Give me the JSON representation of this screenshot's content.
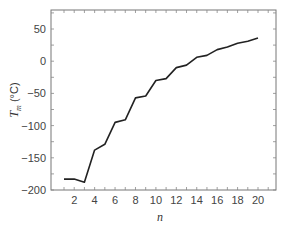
{
  "chart_data": {
    "type": "line",
    "title": "",
    "xlabel": "n",
    "ylabel": "T_m (°C)",
    "ylabel_main": "T",
    "ylabel_sub": "m",
    "ylabel_unit": "(°C)",
    "xlim": [
      0,
      22
    ],
    "ylim": [
      -200,
      80
    ],
    "grid": false,
    "legend": null,
    "x_ticks": [
      2,
      4,
      6,
      8,
      10,
      12,
      14,
      16,
      18,
      20
    ],
    "y_ticks": [
      -200,
      -150,
      -100,
      -50,
      0,
      50
    ],
    "x": [
      1,
      2,
      3,
      4,
      5,
      6,
      7,
      8,
      9,
      10,
      11,
      12,
      13,
      14,
      15,
      16,
      17,
      18,
      19,
      20
    ],
    "series": [
      {
        "name": "T_m",
        "color": "#222222",
        "values": [
          -183,
          -183,
          -188,
          -138,
          -129,
          -95,
          -91,
          -57,
          -54,
          -30,
          -27,
          -10,
          -6,
          6,
          9,
          18,
          22,
          28,
          31,
          36
        ]
      }
    ]
  }
}
